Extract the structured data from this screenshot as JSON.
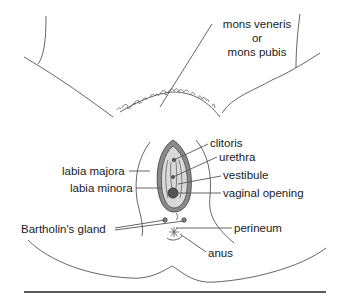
{
  "diagram": {
    "type": "anatomical-illustration",
    "labels": {
      "mons_line1": "mons veneris",
      "mons_line2": "or",
      "mons_line3": "mons pubis",
      "clitoris": "clitoris",
      "urethra": "urethra",
      "vestibule": "vestibule",
      "vaginal_opening": "vaginal opening",
      "labia_majora": "labia majora",
      "labia_minora": "labia minora",
      "bartholins_gland": "Bartholin's gland",
      "perineum": "perineum",
      "anus": "anus"
    },
    "colors": {
      "line": "#555555",
      "fill_light": "#d9d9d9",
      "fill_dark": "#7a7a7a",
      "rule": "#222222"
    }
  }
}
